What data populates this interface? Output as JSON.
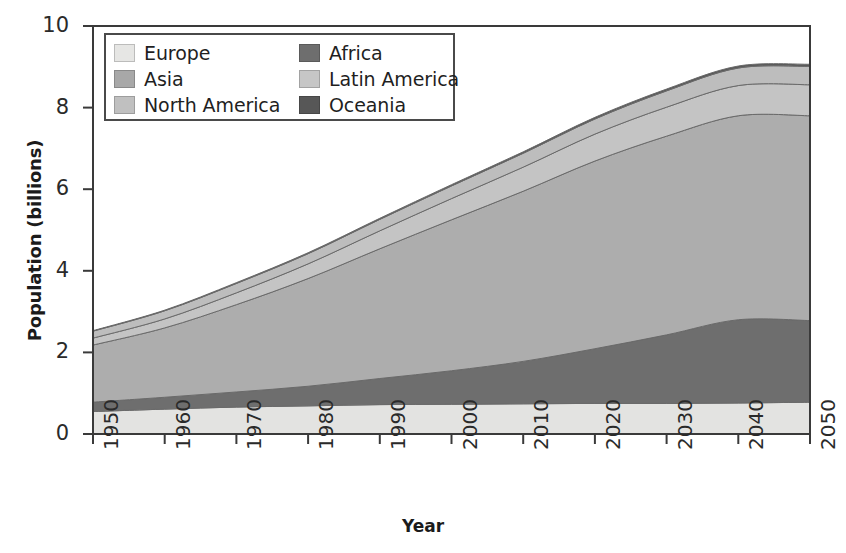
{
  "chart_data": {
    "type": "area",
    "title": "",
    "xlabel": "Year",
    "ylabel": "Population (billions)",
    "xlim": [
      1950,
      2050
    ],
    "ylim": [
      0,
      10
    ],
    "xticks": [
      "1950",
      "1960",
      "1970",
      "1980",
      "1990",
      "2000",
      "2010",
      "2020",
      "2030",
      "2040",
      "2050"
    ],
    "yticks": [
      "0",
      "2",
      "4",
      "6",
      "8",
      "10"
    ],
    "grid": false,
    "stacked": true,
    "legend_position": "top-left",
    "x": [
      1950,
      1960,
      1970,
      1980,
      1990,
      2000,
      2010,
      2020,
      2030,
      2040,
      2050
    ],
    "series": [
      {
        "name": "Europe",
        "color": "#e3e3e1",
        "values": [
          0.55,
          0.61,
          0.66,
          0.69,
          0.72,
          0.73,
          0.74,
          0.75,
          0.75,
          0.76,
          0.78
        ]
      },
      {
        "name": "Africa",
        "color": "#6e6e6e",
        "values": [
          0.23,
          0.29,
          0.37,
          0.48,
          0.64,
          0.82,
          1.04,
          1.34,
          1.68,
          2.04,
          2.0
        ]
      },
      {
        "name": "Asia",
        "color": "#adadad",
        "values": [
          1.4,
          1.7,
          2.14,
          2.64,
          3.18,
          3.7,
          4.17,
          4.6,
          4.87,
          5.0,
          5.02
        ]
      },
      {
        "name": "Latin America",
        "color": "#c4c4c4",
        "values": [
          0.17,
          0.22,
          0.29,
          0.36,
          0.44,
          0.52,
          0.59,
          0.66,
          0.71,
          0.74,
          0.76
        ]
      },
      {
        "name": "North America",
        "color": "#bdbdbd",
        "values": [
          0.17,
          0.2,
          0.23,
          0.25,
          0.28,
          0.31,
          0.34,
          0.37,
          0.4,
          0.43,
          0.45
        ]
      },
      {
        "name": "Oceania",
        "color": "#585858",
        "values": [
          0.013,
          0.016,
          0.02,
          0.023,
          0.027,
          0.031,
          0.036,
          0.041,
          0.045,
          0.049,
          0.053
        ]
      }
    ],
    "totals": [
      2.53,
      3.04,
      3.69,
      4.44,
      5.29,
      6.11,
      6.92,
      7.76,
      8.46,
      9.02,
      9.06
    ]
  },
  "legend": {
    "entries": [
      {
        "label": "Europe",
        "color": "#e6e6e4",
        "name": "europe"
      },
      {
        "label": "Africa",
        "color": "#6e6e6e",
        "name": "africa"
      },
      {
        "label": "Asia",
        "color": "#a8a8a8",
        "name": "asia"
      },
      {
        "label": "Latin America",
        "color": "#c6c6c6",
        "name": "latin-america"
      },
      {
        "label": "North America",
        "color": "#c0c0c0",
        "name": "north-america"
      },
      {
        "label": "Oceania",
        "color": "#575757",
        "name": "oceania"
      }
    ]
  },
  "axes": {
    "x_title": "Year",
    "y_title": "Population (billions)"
  },
  "colors": {
    "axis": "#3a3a3a",
    "text": "#1f1f1f",
    "background": "#ffffff"
  }
}
